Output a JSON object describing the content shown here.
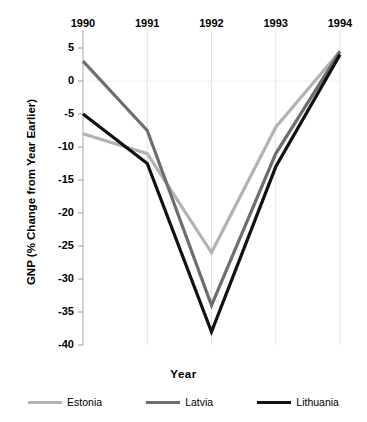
{
  "chart_data": {
    "type": "line",
    "title": "",
    "xlabel": "Year",
    "ylabel": "GNP (% Change from Year Earlier)",
    "categories": [
      "1990",
      "1991",
      "1992",
      "1993",
      "1994"
    ],
    "x": [
      1990,
      1991,
      1992,
      1993,
      1994
    ],
    "xlim": [
      1990,
      1994
    ],
    "ylim": [
      -40,
      5
    ],
    "yticks": [
      5,
      0,
      -5,
      -10,
      -15,
      -20,
      -25,
      -30,
      -35,
      -40
    ],
    "ytick_labels": [
      "5",
      "0",
      "-5",
      "-10",
      "-15",
      "-20",
      "-25",
      "-30",
      "-35",
      "-40"
    ],
    "grid": true,
    "legend_position": "bottom",
    "series": [
      {
        "name": "Estonia",
        "color": "#b3b3b3",
        "values": [
          -8,
          -11,
          -26,
          -7,
          4.5
        ]
      },
      {
        "name": "Latvia",
        "color": "#6e6e6e",
        "values": [
          3,
          -7.5,
          -34,
          -11,
          4.5
        ]
      },
      {
        "name": "Lithuania",
        "color": "#111111",
        "values": [
          -5,
          -12.5,
          -38,
          -13,
          4
        ]
      }
    ]
  },
  "axis": {
    "x_title": "Year",
    "y_title": "GNP (% Change from Year Earlier)"
  },
  "x_labels": [
    {
      "text": "1990"
    },
    {
      "text": "1991"
    },
    {
      "text": "1992"
    },
    {
      "text": "1993"
    },
    {
      "text": "1994"
    }
  ],
  "y_labels": [
    {
      "text": "5"
    },
    {
      "text": "0"
    },
    {
      "text": "-5"
    },
    {
      "text": "-10"
    },
    {
      "text": "-15"
    },
    {
      "text": "-20"
    },
    {
      "text": "-25"
    },
    {
      "text": "-30"
    },
    {
      "text": "-35"
    },
    {
      "text": "-40"
    }
  ],
  "legend": [
    {
      "label": "Estonia",
      "color": "#b3b3b3"
    },
    {
      "label": "Latvia",
      "color": "#6e6e6e"
    },
    {
      "label": "Lithuania",
      "color": "#111111"
    }
  ]
}
